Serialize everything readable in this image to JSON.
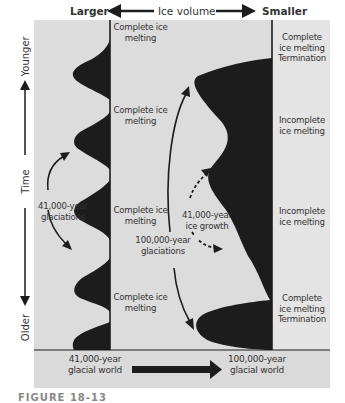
{
  "header": {
    "left": "Larger",
    "center": "Ice volume",
    "right": "Smaller"
  },
  "axis": {
    "top": "Younger",
    "middle": "Time",
    "bottom": "Older"
  },
  "left_column": {
    "labels": [
      "Complete ice melting",
      "Complete ice melting",
      "Complete ice melting",
      "Complete ice melting"
    ],
    "annotation": "41,000-year glaciations"
  },
  "middle": {
    "annotation_100k": "100,000-year glaciations",
    "annotation_41k": "41,000-year ice growth"
  },
  "right_column": {
    "labels": [
      [
        "Complete",
        "ice melting",
        "Termination"
      ],
      [
        "Incomplete",
        "ice melting"
      ],
      [
        "Incomplete",
        "ice melting"
      ],
      [
        "Complete",
        "ice melting",
        "Termination"
      ]
    ]
  },
  "footer": {
    "left": "41,000-year glacial world",
    "right": "100,000-year glacial world"
  },
  "caption": "FIGURE 18-13",
  "colors": {
    "panel": "#dcdcdc",
    "ink": "#1c1c1c",
    "right_col": "#e2e2e2"
  }
}
